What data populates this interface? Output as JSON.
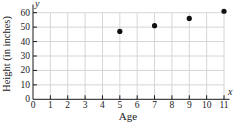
{
  "chart_data": {
    "type": "scatter",
    "title": "",
    "xlabel": "Age",
    "ylabel": "Height (in inches)",
    "x_axis_symbol": "x",
    "y_axis_symbol": "y",
    "xlim": [
      0,
      11
    ],
    "ylim": [
      0,
      60
    ],
    "x_ticks": [
      0,
      1,
      2,
      3,
      4,
      5,
      6,
      7,
      8,
      9,
      10,
      11
    ],
    "y_ticks": [
      0,
      10,
      20,
      30,
      40,
      50,
      60
    ],
    "grid": true,
    "legend": false,
    "points": [
      {
        "x": 5,
        "y": 47
      },
      {
        "x": 7,
        "y": 51
      },
      {
        "x": 9,
        "y": 56
      },
      {
        "x": 11,
        "y": 61
      }
    ],
    "colors": {
      "background": "#ffffff",
      "grid": "#d6d6d6",
      "axis": "#1a1a1a",
      "point": "#111111",
      "text": "#1a1a1a"
    }
  }
}
